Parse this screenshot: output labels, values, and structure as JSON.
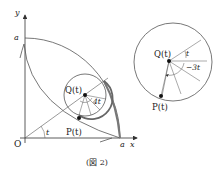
{
  "figure": {
    "caption": "(図 2)",
    "axes": {
      "x_label": "x",
      "y_label": "y",
      "origin_label": "O",
      "x_intercept_label": "a",
      "y_intercept_label": "a"
    },
    "left_diagram": {
      "center_label": "Q(t)",
      "point_label": "P(t)",
      "angle_at_origin": "t",
      "angle_at_center": "4t"
    },
    "right_diagram": {
      "center_label": "Q(t)",
      "point_label": "P(t)",
      "angle_upper": "t",
      "angle_lower": "−3t"
    },
    "colors": {
      "ink": "#333333",
      "thin": "#555555",
      "bold_arc": "#777777"
    }
  }
}
